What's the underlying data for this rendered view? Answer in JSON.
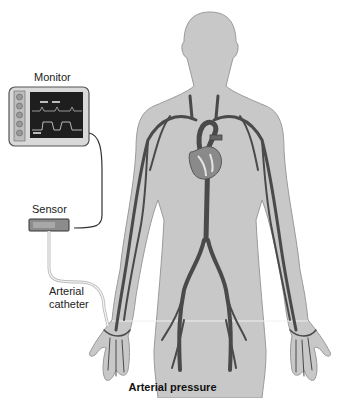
{
  "figure": {
    "caption": "Arterial pressure",
    "labels": {
      "monitor": "Monitor",
      "sensor": "Sensor",
      "catheter_line1": "Arterial",
      "catheter_line2": "catheter"
    },
    "components": [
      {
        "name": "monitor",
        "icon": "monitor-icon"
      },
      {
        "name": "sensor",
        "icon": "pressure-transducer-icon"
      },
      {
        "name": "arterial-catheter",
        "icon": "catheter-tube-icon"
      },
      {
        "name": "human-body",
        "icon": "body-silhouette-icon"
      },
      {
        "name": "heart",
        "icon": "heart-icon"
      },
      {
        "name": "arteries",
        "icon": "artery-network-icon"
      }
    ],
    "colors": {
      "body_fill": "#c8c8c8",
      "body_stroke": "#9a9a9a",
      "artery": "#4a4a4a",
      "monitor_frame": "#d9d9d9",
      "monitor_screen": "#1e1e1e",
      "sensor_fill": "#8c8c8c",
      "cable": "#333333",
      "catheter_tube": "#bdbdbd"
    }
  }
}
